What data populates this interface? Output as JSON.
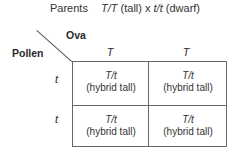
{
  "parents": {
    "label": "Parents",
    "genotype1": "T/T",
    "phenotype1": "(tall)",
    "cross_symbol": "x",
    "genotype2": "t/t",
    "phenotype2": "(dwarf)"
  },
  "axes": {
    "ova_label": "Ova",
    "pollen_label": "Pollen"
  },
  "columns": [
    "T",
    "T"
  ],
  "rows": [
    "t",
    "t"
  ],
  "cells": [
    [
      {
        "genotype": "T/t",
        "phenotype": "(hybrid tall)"
      },
      {
        "genotype": "T/t",
        "phenotype": "(hybrid tall)"
      }
    ],
    [
      {
        "genotype": "T/t",
        "phenotype": "(hybrid tall)"
      },
      {
        "genotype": "T/t",
        "phenotype": "(hybrid tall)"
      }
    ]
  ]
}
